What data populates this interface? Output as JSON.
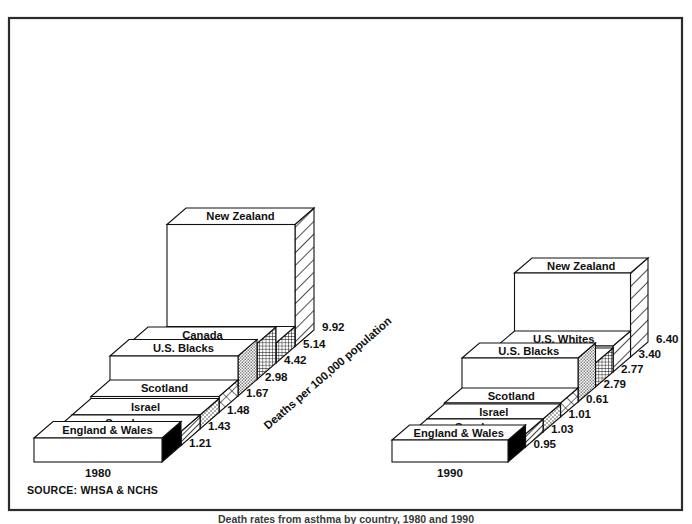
{
  "figure": {
    "source_note": "SOURCE: WHSA & NCHS",
    "axis_title": "Deaths per 100,000 population",
    "caption": "Death rates from asthma by country, 1980 and 1990"
  },
  "colors": {
    "ink": "#111111",
    "frame": "#2b2b2b",
    "paper": "#ffffff",
    "solid_black": "#000000"
  },
  "panels": [
    {
      "year_label": "1980",
      "key": "left"
    },
    {
      "year_label": "1990",
      "key": "right"
    }
  ],
  "chart_data": {
    "type": "bar",
    "title": "Death rates from asthma by country, 1980 and 1990",
    "subtitle": "",
    "xlabel": "",
    "ylabel": "Deaths per 100,000 population",
    "ylim": [
      0,
      10
    ],
    "grid": false,
    "legend_position": "none",
    "annotations": [
      "SOURCE: WHSA & NCHS",
      "Deaths per 100,000 population"
    ],
    "categories": [
      "England & Wales",
      "Sweden",
      "Israel",
      "Scotland",
      "U.S. Blacks",
      "Canada",
      "U.S. Whites",
      "New Zealand"
    ],
    "series": [
      {
        "name": "1980",
        "values": [
          1.21,
          1.43,
          1.48,
          1.67,
          2.98,
          4.42,
          5.14,
          9.92
        ]
      },
      {
        "name": "1990",
        "values": [
          0.95,
          1.03,
          1.01,
          0.61,
          2.79,
          2.77,
          3.4,
          6.4
        ]
      }
    ]
  },
  "left_panel": {
    "year": "1980",
    "bars": [
      {
        "label": "England & Wales",
        "value": "1.21",
        "pattern": "solid-black"
      },
      {
        "label": "Sweden",
        "value": "1.43",
        "pattern": "dense-diagonal"
      },
      {
        "label": "Israel",
        "value": "1.48",
        "pattern": "stipple-light"
      },
      {
        "label": "Scotland",
        "value": "1.67",
        "pattern": "diamond-lattice"
      },
      {
        "label": "U.S. Blacks",
        "value": "2.98",
        "pattern": "stipple-fine"
      },
      {
        "label": "Canada",
        "value": "4.42",
        "pattern": "grid-fine"
      },
      {
        "label": "U.S. Whites",
        "value": "5.14",
        "pattern": "grid-fine"
      },
      {
        "label": "New Zealand",
        "value": "9.92",
        "pattern": "wide-diagonal"
      }
    ]
  },
  "right_panel": {
    "year": "1990",
    "bars": [
      {
        "label": "England & Wales",
        "value": "0.95",
        "pattern": "solid-black"
      },
      {
        "label": "Sweden",
        "value": "1.03",
        "pattern": "dense-diagonal"
      },
      {
        "label": "Israel",
        "value": "1.01",
        "pattern": "stipple-light"
      },
      {
        "label": "Scotland",
        "value": "0.61",
        "pattern": "diamond-lattice"
      },
      {
        "label": "U.S. Blacks",
        "value": "2.79",
        "pattern": "stipple-fine"
      },
      {
        "label": "Canada",
        "value": "2.77",
        "pattern": "grid-fine"
      },
      {
        "label": "U.S. Whites",
        "value": "3.40",
        "pattern": "wide-diagonal"
      },
      {
        "label": "New Zealand",
        "value": "6.40",
        "pattern": "wide-diagonal"
      }
    ]
  }
}
